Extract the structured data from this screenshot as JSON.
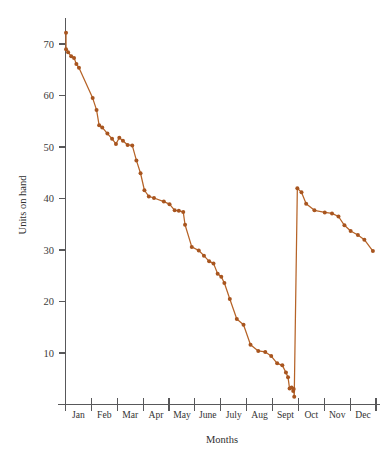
{
  "chart_data": {
    "type": "line",
    "title": "",
    "xlabel": "Months",
    "ylabel": "Units on hand",
    "ylim": [
      0,
      73
    ],
    "xlim": [
      0,
      12
    ],
    "grid": false,
    "legend": null,
    "yticks": [
      10,
      20,
      30,
      40,
      50,
      60,
      70
    ],
    "ytick_labels": [
      "10",
      "20",
      "30",
      "40",
      "50",
      "60",
      "70"
    ],
    "categories": [
      "Jan",
      "Feb",
      "Mar",
      "Apr",
      "May",
      "June",
      "July",
      "Aug",
      "Sept",
      "Oct",
      "Nov",
      "Dec"
    ],
    "line_color": "#b66327",
    "marker_color": "#a8551f",
    "axis_color": "#58585a",
    "series": [
      {
        "name": "Units on hand",
        "x": [
          0.02,
          0.02,
          0.1,
          0.22,
          0.33,
          0.42,
          0.52,
          1.05,
          1.2,
          1.3,
          1.42,
          1.62,
          1.8,
          1.95,
          2.08,
          2.22,
          2.4,
          2.58,
          2.74,
          2.9,
          3.05,
          3.22,
          3.42,
          3.8,
          4.02,
          4.22,
          4.38,
          4.55,
          4.62,
          4.88,
          5.15,
          5.35,
          5.55,
          5.72,
          5.88,
          6.02,
          6.14,
          6.35,
          6.62,
          6.88,
          7.15,
          7.45,
          7.72,
          7.95,
          8.18,
          8.38,
          8.52,
          8.6,
          8.66,
          8.74,
          8.8,
          8.82,
          8.84,
          8.96,
          9.12,
          9.3,
          9.62,
          10.02,
          10.3,
          10.55,
          10.78,
          11.02,
          11.3,
          11.55,
          11.88
        ],
        "y": [
          72.2,
          69.0,
          68.4,
          67.6,
          67.3,
          66.1,
          65.4,
          59.5,
          57.2,
          54.2,
          53.8,
          52.6,
          51.6,
          50.6,
          51.8,
          51.2,
          50.4,
          50.3,
          47.4,
          44.9,
          41.6,
          40.4,
          40.1,
          39.4,
          38.9,
          37.7,
          37.6,
          37.4,
          34.9,
          30.6,
          29.9,
          28.9,
          27.8,
          27.4,
          25.4,
          24.8,
          23.6,
          20.5,
          16.6,
          15.5,
          11.6,
          10.4,
          10.2,
          9.4,
          8.0,
          7.6,
          6.2,
          5.3,
          3.1,
          3.3,
          2.6,
          3.0,
          1.5,
          42.0,
          41.2,
          39.0,
          37.7,
          37.3,
          37.1,
          36.5,
          34.8,
          33.7,
          32.9,
          32.0,
          29.8
        ]
      }
    ],
    "annotations": [
      {
        "kind": "vertical-restock-line",
        "x": 8.84,
        "y_from": 1.5,
        "y_to": 42.0,
        "description": "Inventory replenishment jump at end of Sept"
      },
      {
        "kind": "initial-vertical-segment",
        "x": 0.02,
        "y_from": 69.0,
        "y_to": 72.2,
        "description": "Starting stock spike at Jan"
      }
    ]
  },
  "axes": {
    "y_title": "Units on hand",
    "x_title": "Months"
  }
}
